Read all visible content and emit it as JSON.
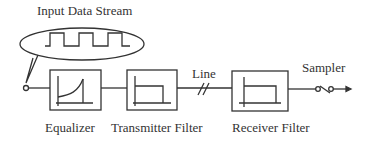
{
  "diagram": {
    "input_label": "Input Data Stream",
    "blocks": [
      {
        "id": "equalizer",
        "label": "Equalizer",
        "icon": "equalizer-response-curve"
      },
      {
        "id": "transmitter-filter",
        "label": "Transmitter Filter",
        "icon": "lowpass-filter-response"
      },
      {
        "id": "receiver-filter",
        "label": "Receiver Filter",
        "icon": "lowpass-filter-response"
      }
    ],
    "line_label": "Line",
    "sampler_label": "Sampler",
    "colors": {
      "stroke": "#333333",
      "background": "#ffffff"
    }
  }
}
